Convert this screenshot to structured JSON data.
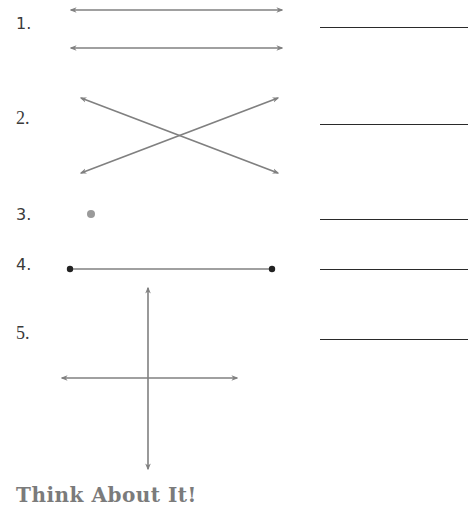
{
  "problems": [
    {
      "number": "1.",
      "figure": "parallel-lines",
      "answer": ""
    },
    {
      "number": "2.",
      "figure": "intersecting-lines",
      "answer": ""
    },
    {
      "number": "3.",
      "figure": "point",
      "answer": ""
    },
    {
      "number": "4.",
      "figure": "line-segment",
      "answer": ""
    },
    {
      "number": "5.",
      "figure": "perpendicular-lines",
      "answer": ""
    }
  ],
  "heading": "Think About It!",
  "colors": {
    "line": "#808080",
    "point_gray": "#9a9a9a",
    "endpoint": "#222222",
    "answer_line": "#2a2a2a",
    "heading": "#7b7b7b"
  }
}
